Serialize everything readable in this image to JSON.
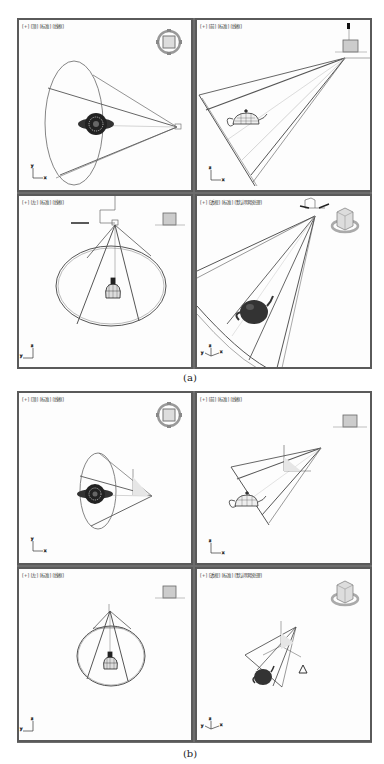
{
  "figure_a": {
    "caption": "(a)",
    "viewports": [
      {
        "position": "top-left",
        "label": "[+] [顶] [标准] [线框]",
        "view": "top",
        "viewcube_icon": "compass-ring-icon",
        "viewcube_text": "上"
      },
      {
        "position": "top-right",
        "label": "[+] [前] [标准] [线框]",
        "view": "front",
        "viewcube_icon": "viewcube-flat-icon",
        "viewcube_text": "前"
      },
      {
        "position": "bottom-left",
        "label": "[+] [左] [标准] [线框]",
        "view": "left",
        "viewcube_icon": "viewcube-flat-icon",
        "viewcube_text": "左"
      },
      {
        "position": "bottom-right",
        "label": "[+] [透视] [标准] [默认明暗处理]",
        "view": "perspective",
        "viewcube_icon": "viewcube-3d-icon",
        "viewcube_text": ""
      }
    ]
  },
  "figure_b": {
    "caption": "(b)",
    "viewports": [
      {
        "position": "top-left",
        "label": "[+] [顶] [标准] [线框]",
        "view": "top",
        "viewcube_icon": "compass-ring-icon",
        "viewcube_text": "上"
      },
      {
        "position": "top-right",
        "label": "[+] [前] [标准] [线框]",
        "view": "front",
        "viewcube_icon": "viewcube-flat-icon",
        "viewcube_text": "前"
      },
      {
        "position": "bottom-left",
        "label": "[+] [左] [标准] [线框]",
        "view": "left",
        "viewcube_icon": "viewcube-flat-icon",
        "viewcube_text": "左"
      },
      {
        "position": "bottom-right",
        "label": "[+] [透视] [标准] [默认明暗处理]",
        "view": "perspective",
        "viewcube_icon": "viewcube-3d-icon",
        "viewcube_text": ""
      }
    ]
  },
  "axis_labels": {
    "x": "x",
    "y": "y",
    "z": "z"
  },
  "colors": {
    "border": "#5a5a5a",
    "viewport_bg": "#fdfdfd",
    "wire": "#555555",
    "teapot": "#333333"
  }
}
